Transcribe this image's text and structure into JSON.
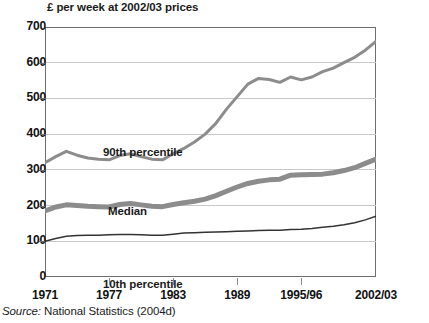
{
  "chart_title": "£ per week at 2002/03 prices",
  "source_note": {
    "label": "Source:",
    "text": "National Statistics (2004d)"
  },
  "axes": {
    "y_ticks": [
      "0",
      "100",
      "200",
      "300",
      "400",
      "500",
      "600",
      "700"
    ],
    "x_ticks": [
      "1971",
      "1977",
      "1983",
      "1989",
      "1995/96",
      "2002/03"
    ]
  },
  "series_labels": {
    "p90": "90th percentile",
    "median": "Median",
    "p10": "10th percentile"
  },
  "colors": {
    "p90_line": "#8c8c8c",
    "median_line": "#8c8c8c",
    "p10_line": "#333333",
    "gridline": "#c9c9c9",
    "frame": "#6e6e6e",
    "text": "#1b1b1b",
    "background": "#ffffff"
  },
  "chart_data": {
    "type": "line",
    "title": "£ per week at 2002/03 prices",
    "xlabel": "",
    "ylabel": "£ per week at 2002/03 prices",
    "ylim": [
      0,
      700
    ],
    "ytick_step": 100,
    "grid": true,
    "legend": "in-plot labels",
    "x": [
      "1971",
      "1972",
      "1973",
      "1974",
      "1975",
      "1976",
      "1977",
      "1978",
      "1979",
      "1980",
      "1981",
      "1982",
      "1983",
      "1984",
      "1985",
      "1986",
      "1987",
      "1988",
      "1989",
      "1990",
      "1991",
      "1992",
      "1993",
      "1994/95",
      "1995/96",
      "1996/97",
      "1997/98",
      "1998/99",
      "1999/00",
      "2000/01",
      "2001/02",
      "2002/03"
    ],
    "x_tick_labels": [
      "1971",
      "1977",
      "1983",
      "1989",
      "1995/96",
      "2002/03"
    ],
    "x_tick_indices": [
      0,
      6,
      12,
      18,
      24,
      31
    ],
    "series": [
      {
        "name": "90th percentile",
        "color": "#8c8c8c",
        "width": 3,
        "values": [
          320,
          337,
          352,
          341,
          333,
          330,
          328,
          340,
          345,
          337,
          330,
          328,
          345,
          360,
          378,
          400,
          430,
          470,
          505,
          540,
          556,
          553,
          545,
          560,
          552,
          560,
          575,
          585,
          600,
          615,
          635,
          660
        ]
      },
      {
        "name": "Median",
        "color": "#8c8c8c",
        "width": 5,
        "values": [
          185,
          196,
          202,
          200,
          198,
          197,
          196,
          203,
          206,
          202,
          198,
          197,
          203,
          208,
          212,
          218,
          228,
          240,
          252,
          262,
          268,
          272,
          274,
          285,
          286,
          287,
          288,
          292,
          298,
          306,
          318,
          330
        ]
      },
      {
        "name": "10th percentile",
        "color": "#333333",
        "width": 1.5,
        "values": [
          100,
          108,
          114,
          116,
          117,
          117,
          118,
          119,
          119,
          118,
          117,
          117,
          120,
          123,
          124,
          125,
          126,
          127,
          128,
          129,
          130,
          131,
          131,
          133,
          134,
          136,
          139,
          142,
          146,
          152,
          160,
          170
        ]
      }
    ]
  }
}
